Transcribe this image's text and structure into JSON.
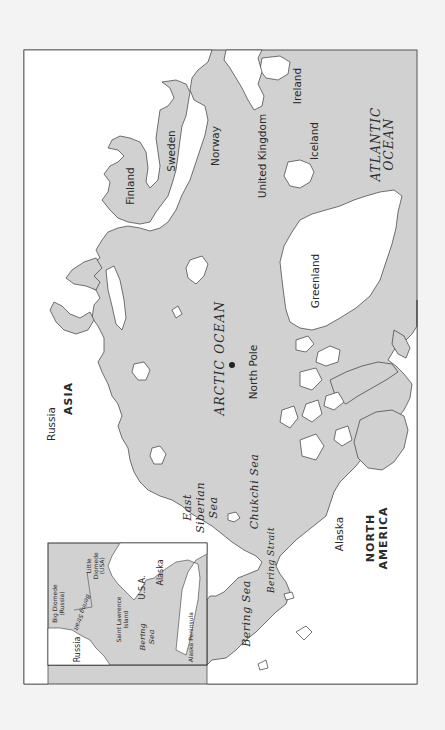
{
  "map": {
    "title": "Arctic region map",
    "orientation": "rotated 90 degrees counter-clockwise",
    "colors": {
      "page": "#f3f3f3",
      "ocean": "#d1d1d1",
      "land": "#ffffff",
      "coastline": "#3a3a3a",
      "frame": "#555555"
    },
    "continents": {
      "asia": "ASIA",
      "north_america_line1": "NORTH",
      "north_america_line2": "AMERICA"
    },
    "oceans": {
      "arctic": "ARCTIC OCEAN",
      "atlantic_line1": "ATLANTIC",
      "atlantic_line2": "OCEAN"
    },
    "seas": {
      "east_siberian_line1": "East",
      "east_siberian_line2": "Siberian",
      "east_siberian_line3": "Sea",
      "chukchi": "Chukchi Sea",
      "bering": "Bering Sea",
      "bering_strait": "Bering Strait"
    },
    "countries": {
      "russia": "Russia",
      "finland": "Finland",
      "sweden": "Sweden",
      "norway": "Norway",
      "united_kingdom": "United Kingdom",
      "ireland": "Ireland",
      "iceland": "Iceland",
      "greenland": "Greenland",
      "alaska": "Alaska"
    },
    "point_features": {
      "north_pole": "North Pole"
    },
    "inset": {
      "russia": "Russia",
      "big_diomede_line1": "Big Diomede",
      "big_diomede_line2": "(Russia)",
      "little_diomede_line1": "Little",
      "little_diomede_line2": "Diomede",
      "little_diomede_line3": "(USA)",
      "bering_strait": "Bering Strait",
      "saint_lawrence_line1": "Saint Lawrence",
      "saint_lawrence_line2": "Island",
      "usa": "U.S.A.",
      "alaska": "Alaska",
      "bering_sea_line1": "Bering",
      "bering_sea_line2": "Sea",
      "alaska_peninsula": "Alaska Peninsula"
    }
  }
}
